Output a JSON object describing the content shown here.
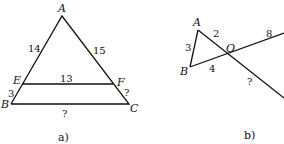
{
  "figure_a": {
    "caption": "a)",
    "vertices": {
      "A": "A",
      "B": "B",
      "C": "C",
      "E": "E",
      "F": "F"
    },
    "lengths": {
      "AE": "14",
      "AF": "15",
      "EF": "13",
      "EB": "3",
      "FC": "?",
      "BC": "?"
    }
  },
  "figure_b": {
    "caption": "b)",
    "vertices": {
      "A": "A",
      "B": "B",
      "O": "O"
    },
    "lengths": {
      "AB": "3",
      "AO": "2",
      "BO": "4",
      "O_ray_up": "8",
      "O_ray_down": "?"
    }
  }
}
